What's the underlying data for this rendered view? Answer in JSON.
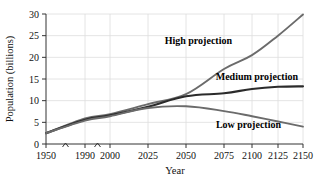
{
  "chart_data": {
    "type": "line",
    "title": "",
    "xlabel": "Year",
    "ylabel": "Population (billions)",
    "xlim": [
      1950,
      2150
    ],
    "ylim": [
      0,
      30
    ],
    "grid": true,
    "legend_position": "inline-annotations",
    "x_ticks": [
      1950,
      1990,
      2000,
      2025,
      2050,
      2075,
      2100,
      2125,
      2150
    ],
    "x_tick_labels": [
      "1950",
      "1990",
      "2000",
      "2025",
      "2050",
      "2075",
      "2100",
      "2125",
      "2150"
    ],
    "y_ticks": [
      0,
      5,
      10,
      15,
      20,
      25,
      30
    ],
    "y_tick_labels": [
      "0",
      "5",
      "10",
      "15",
      "20",
      "25",
      "30"
    ],
    "axis_breaks": [
      1970,
      1995
    ],
    "note": "x-axis uses non-uniform (broken) spacing between 1950, 1990, 2000 and then even 25-year steps",
    "series": [
      {
        "name": "High projection",
        "color": "#6b6b6b",
        "width": 1.9,
        "x": [
          1950,
          1990,
          2000,
          2025,
          2050,
          2075,
          2100,
          2125,
          2150
        ],
        "values": [
          2.5,
          5.9,
          6.9,
          9.2,
          11.5,
          17.3,
          20.5,
          25.0,
          29.9
        ]
      },
      {
        "name": "Medium projection",
        "color": "#2b2b2b",
        "width": 2.1,
        "x": [
          1950,
          1990,
          2000,
          2025,
          2050,
          2075,
          2100,
          2125,
          2150
        ],
        "values": [
          2.5,
          5.6,
          6.6,
          8.6,
          11.0,
          11.7,
          12.7,
          13.2,
          13.3
        ]
      },
      {
        "name": "Low projection",
        "color": "#6b6b6b",
        "width": 1.9,
        "x": [
          1950,
          1990,
          2000,
          2025,
          2050,
          2075,
          2100,
          2125,
          2150
        ],
        "values": [
          2.5,
          5.4,
          6.4,
          8.3,
          8.7,
          7.6,
          6.4,
          5.2,
          4.0
        ]
      }
    ],
    "annotations": [
      {
        "text": "High projection",
        "x": 232,
        "y": 44
      },
      {
        "text": "Medium projection",
        "x": 298,
        "y": 80
      },
      {
        "text": "Low projection",
        "x": 281,
        "y": 128
      }
    ]
  },
  "colors": {
    "grid": "#dddddd",
    "axis": "#333333",
    "text": "#111111",
    "high": "#6b6b6b",
    "medium": "#2b2b2b",
    "low": "#6b6b6b",
    "background": "#ffffff"
  }
}
